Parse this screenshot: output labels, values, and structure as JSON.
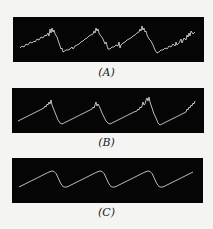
{
  "figure": {
    "background": "#f4f4f2",
    "panel_color": "#050505",
    "trace_color": "#e8e8e8",
    "panels": [
      {
        "id": "A",
        "label": "(A)",
        "description": "Noisy sawtooth waveform with heavy jitter",
        "box": {
          "x": 13,
          "y": 17,
          "w": 191,
          "h": 45
        },
        "path": "M7,31 L9,29 L11,30 L13,27 L15,28 L17,25 L19,26 L21,24 L22,25 L24,22 L26,23 L28,20 L30,21 L32,18 L33,19 L35,16 L36,19 L37,12 L38,16 L39,11 L40,15 L41,13 L42,17 L44,20 L46,26 L48,32 L49,31 L50,35 L53,33 L55,33 L57,32 L59,30 L60,32 L62,29 L64,28 L66,27 L68,25 L70,24 L72,22 L74,21 L76,19 L78,18 L80,17 L81,14 L82,16 L83,11 L84,14 L85,12 L86,16 L87,18 L88,19 L90,22 L92,27 L93,25 L95,32 L97,32 L99,30 L101,30 L103,28 L105,29 L106,25 L107,31 L108,28 L110,26 L112,25 L114,23 L116,22 L118,21 L120,19 L122,18 L124,16 L126,15 L127,12 L128,14 L129,9 L130,13 L131,11 L132,15 L133,14 L134,18 L136,22 L138,24 L140,28 L142,33 L144,36 L146,35 L148,33 L150,33 L152,31 L154,32 L156,29 L158,30 L160,27 L162,29 L163,25 L164,28 L166,26 L168,22 L169,26 L171,21 L173,23 L174,18 L175,20 L176,16 L177,19 L178,14 L180,17 L182,15"
      },
      {
        "id": "B",
        "label": "(B)",
        "description": "Sawtooth waveform with moderate jitter near peaks",
        "box": {
          "x": 12,
          "y": 88,
          "w": 192,
          "h": 45
        },
        "path": "M6,33 L10,31 L14,29 L18,27 L22,25 L26,23 L30,21 L32,20 L33,18 L34,19 L35,16 L36,17 L37,14 L38,16 L39,12 L40,17 L42,22 L44,27 L46,32 L48,35 L50,36 L54,34 L58,32 L62,30 L66,28 L70,26 L74,24 L78,22 L80,21 L81,19 L82,20 L83,17 L84,14 L85,18 L86,16 L88,20 L90,25 L92,29 L94,33 L96,35 L98,36 L102,34 L106,32 L110,30 L114,28 L118,26 L122,24 L125,23 L126,21 L127,22 L128,19 L129,20 L130,18 L131,14 L132,17 L133,16 L134,12 L135,10 L136,13 L137,9 L138,14 L140,20 L142,26 L144,30 L146,35 L148,37 L152,35 L156,33 L160,31 L164,29 L168,27 L172,25 L174,24 L175,21 L176,22 L177,19 L178,20 L179,17 L180,18 L181,15 L182,16 L183,13"
      },
      {
        "id": "C",
        "label": "(C)",
        "description": "Clean sawtooth waveform",
        "box": {
          "x": 12,
          "y": 158,
          "w": 191,
          "h": 45
        },
        "path": "M7,29 L12,26.5 L17,24 L22,21.5 L27,19 L32,16.5 L37,14 L40,13 L42,13.5 L44,15.5 L46,19.5 L48,24 L50,27.5 L52,29 L55,29 L60,26.5 L65,24 L70,21.5 L75,19 L80,16.5 L85,14 L88,13 L90,13.5 L92,15.5 L94,19.5 L96,24 L98,27.5 L100,29 L103,29 L108,26.5 L113,24 L118,21.5 L123,19 L128,16.5 L133,14 L136,13 L138,13.5 L140,15.5 L142,19.5 L144,24 L146,27.5 L148,29 L151,29 L156,26.5 L161,24 L166,21.5 L171,19 L176,16.5 L181,14"
      }
    ]
  }
}
